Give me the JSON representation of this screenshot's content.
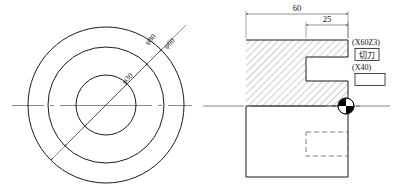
{
  "drawing": {
    "title": "CNC Lathe Turning Part Drawing",
    "left_view": {
      "name": "End View (concentric circles)",
      "center": {
        "x": 106,
        "y": 105
      },
      "circles": [
        {
          "label": "φ80",
          "diameter": 80,
          "radius_px": 78
        },
        {
          "label": "φ60",
          "diameter": 60,
          "radius_px": 58
        },
        {
          "label": "φ30",
          "diameter": 30,
          "radius_px": 30
        }
      ],
      "centerline_label": ""
    },
    "right_view": {
      "name": "Sectional Side View",
      "dimensions": [
        {
          "label": "60",
          "value": 60
        },
        {
          "label": "25",
          "value": 25
        }
      ],
      "annotations": {
        "coord_upper": "(X60Z3)",
        "tool_name": "切刀",
        "coord_lower": "(X40)",
        "empty_box": ""
      },
      "tool_marker": "tool-position-symbol"
    }
  },
  "colors": {
    "line": "#1a1a1a",
    "thin": "#3a3a3a",
    "center": "#555555",
    "dashed": "#707070",
    "hatch": "#555555",
    "marker": "#000000",
    "background": "#ffffff"
  }
}
